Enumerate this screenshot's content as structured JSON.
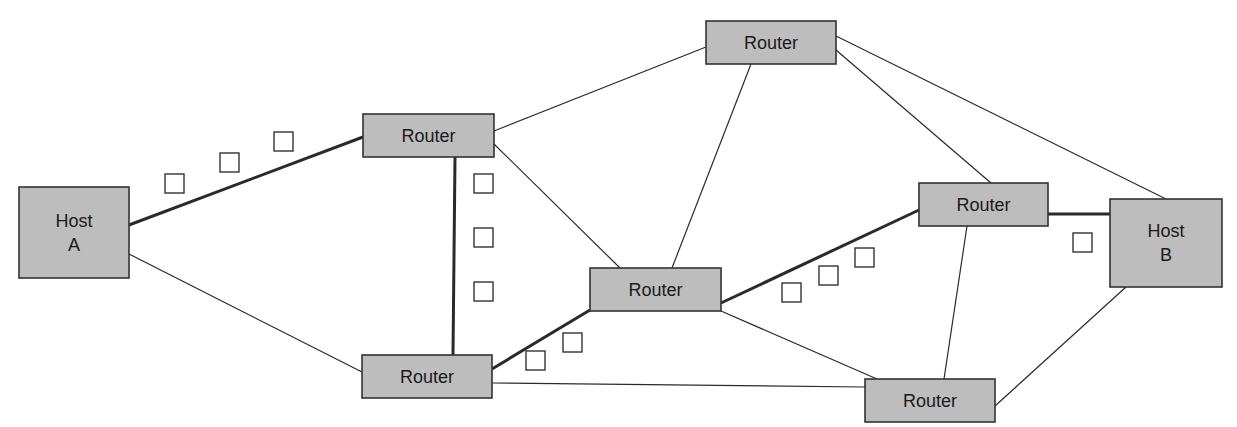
{
  "diagram": {
    "type": "network-routing",
    "colors": {
      "node_fill": "#bdbdbd",
      "node_stroke": "#333333",
      "line": "#2a2a2a",
      "packet_fill": "#ffffff",
      "background": "#ffffff"
    },
    "nodes": [
      {
        "id": "hostA",
        "label_lines": [
          "Host",
          "A"
        ],
        "kind": "host",
        "x": 19,
        "y": 187,
        "w": 110,
        "h": 91
      },
      {
        "id": "r1",
        "label_lines": [
          "Router"
        ],
        "kind": "router",
        "x": 363,
        "y": 114,
        "w": 131,
        "h": 43
      },
      {
        "id": "r2",
        "label_lines": [
          "Router"
        ],
        "kind": "router",
        "x": 362,
        "y": 355,
        "w": 130,
        "h": 43
      },
      {
        "id": "r3",
        "label_lines": [
          "Router"
        ],
        "kind": "router",
        "x": 706,
        "y": 21,
        "w": 130,
        "h": 43
      },
      {
        "id": "r4",
        "label_lines": [
          "Router"
        ],
        "kind": "router",
        "x": 590,
        "y": 268,
        "w": 131,
        "h": 43
      },
      {
        "id": "r5",
        "label_lines": [
          "Router"
        ],
        "kind": "router",
        "x": 919,
        "y": 183,
        "w": 129,
        "h": 43
      },
      {
        "id": "r6",
        "label_lines": [
          "Router"
        ],
        "kind": "router",
        "x": 865,
        "y": 379,
        "w": 130,
        "h": 43
      },
      {
        "id": "hostB",
        "label_lines": [
          "Host",
          "B"
        ],
        "kind": "host",
        "x": 1110,
        "y": 199,
        "w": 112,
        "h": 88
      }
    ],
    "links": [
      {
        "from": "hostA",
        "to": "r1",
        "path": true,
        "x1": 129,
        "y1": 225,
        "x2": 363,
        "y2": 137
      },
      {
        "from": "hostA",
        "to": "r2",
        "path": false,
        "x1": 129,
        "y1": 254,
        "x2": 362,
        "y2": 372
      },
      {
        "from": "r1",
        "to": "r2",
        "path": true,
        "x1": 455,
        "y1": 157,
        "x2": 453,
        "y2": 355
      },
      {
        "from": "r1",
        "to": "r3",
        "path": false,
        "x1": 494,
        "y1": 131,
        "x2": 706,
        "y2": 47
      },
      {
        "from": "r1",
        "to": "r4",
        "path": false,
        "x1": 494,
        "y1": 144,
        "x2": 620,
        "y2": 268
      },
      {
        "from": "r2",
        "to": "r4",
        "path": true,
        "x1": 492,
        "y1": 369,
        "x2": 590,
        "y2": 310
      },
      {
        "from": "r2",
        "to": "r6",
        "path": false,
        "x1": 492,
        "y1": 383,
        "x2": 865,
        "y2": 387
      },
      {
        "from": "r3",
        "to": "r4",
        "path": false,
        "x1": 751,
        "y1": 64,
        "x2": 672,
        "y2": 268
      },
      {
        "from": "r3",
        "to": "r5",
        "path": false,
        "x1": 836,
        "y1": 50,
        "x2": 991,
        "y2": 183
      },
      {
        "from": "r3",
        "to": "hostB",
        "path": false,
        "x1": 836,
        "y1": 36,
        "x2": 1166,
        "y2": 199
      },
      {
        "from": "r4",
        "to": "r5",
        "path": true,
        "x1": 721,
        "y1": 303,
        "x2": 919,
        "y2": 210
      },
      {
        "from": "r4",
        "to": "r6",
        "path": false,
        "x1": 721,
        "y1": 311,
        "x2": 877,
        "y2": 379
      },
      {
        "from": "r5",
        "to": "r6",
        "path": false,
        "x1": 967,
        "y1": 226,
        "x2": 944,
        "y2": 379
      },
      {
        "from": "r5",
        "to": "hostB",
        "path": true,
        "x1": 1048,
        "y1": 214,
        "x2": 1110,
        "y2": 214
      },
      {
        "from": "hostB",
        "to": "r6",
        "path": false,
        "x1": 1126,
        "y1": 287,
        "x2": 995,
        "y2": 406
      }
    ],
    "packets": [
      {
        "segment": "hostA-r1",
        "x": 165,
        "y": 174
      },
      {
        "segment": "hostA-r1",
        "x": 220,
        "y": 153
      },
      {
        "segment": "hostA-r1",
        "x": 274,
        "y": 132
      },
      {
        "segment": "r1-r2",
        "x": 474,
        "y": 174
      },
      {
        "segment": "r1-r2",
        "x": 474,
        "y": 228
      },
      {
        "segment": "r1-r2",
        "x": 474,
        "y": 282
      },
      {
        "segment": "r2-r4",
        "x": 526,
        "y": 351
      },
      {
        "segment": "r2-r4",
        "x": 563,
        "y": 333
      },
      {
        "segment": "r4-r5",
        "x": 782,
        "y": 283
      },
      {
        "segment": "r4-r5",
        "x": 819,
        "y": 266
      },
      {
        "segment": "r4-r5",
        "x": 855,
        "y": 248
      },
      {
        "segment": "r5-hostB",
        "x": 1073,
        "y": 233
      }
    ],
    "packet_size": 19
  }
}
